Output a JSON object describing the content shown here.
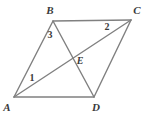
{
  "figure": {
    "background_color": "#ffffff",
    "line_color": "#808080",
    "label_color": "#3a3a3a",
    "line_width": 1.4,
    "width": 144,
    "height": 119
  },
  "points": {
    "A": {
      "label": "A",
      "x": 14,
      "y": 97,
      "label_x": 7,
      "label_y": 107
    },
    "B": {
      "label": "B",
      "x": 53,
      "y": 21,
      "label_x": 50,
      "label_y": 10
    },
    "C": {
      "label": "C",
      "x": 131,
      "y": 20,
      "label_x": 137,
      "label_y": 10
    },
    "D": {
      "label": "D",
      "x": 94,
      "y": 97,
      "label_x": 96,
      "label_y": 107
    },
    "E": {
      "label": "E",
      "x": 70,
      "y": 57,
      "label_x": 80,
      "label_y": 61
    }
  },
  "segments": [
    {
      "name": "side-AB",
      "from": "A",
      "to": "B"
    },
    {
      "name": "side-BC",
      "from": "B",
      "to": "C"
    },
    {
      "name": "side-CD",
      "from": "C",
      "to": "D"
    },
    {
      "name": "side-DA",
      "from": "D",
      "to": "A"
    },
    {
      "name": "diagonal-AC",
      "from": "A",
      "to": "C"
    },
    {
      "name": "diagonal-BD",
      "from": "B",
      "to": "D"
    }
  ],
  "angle_labels": {
    "one": {
      "text": "1",
      "x": 32,
      "y": 78,
      "at_vertex": "A"
    },
    "two": {
      "text": "2",
      "x": 107,
      "y": 27,
      "at_vertex": "C"
    },
    "three": {
      "text": "3",
      "x": 50,
      "y": 35,
      "at_vertex": "B"
    }
  }
}
